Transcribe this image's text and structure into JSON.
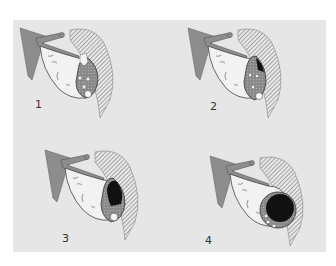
{
  "figure": {
    "background_color": "#e6e6e6",
    "panels": [
      {
        "label": "1",
        "stage": 1
      },
      {
        "label": "2",
        "stage": 2
      },
      {
        "label": "3",
        "stage": 3
      },
      {
        "label": "4",
        "stage": 4
      }
    ]
  }
}
